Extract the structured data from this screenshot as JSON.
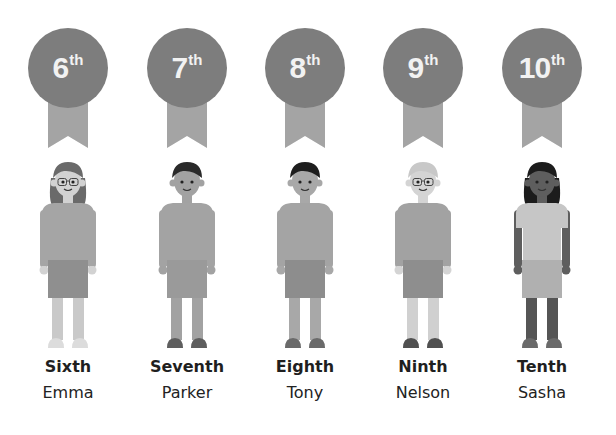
{
  "places": [
    {
      "number": "6",
      "suffix": "th",
      "ordinal": "Sixth",
      "name": "Emma",
      "colors": {
        "hair": "#6a6a6a",
        "skin": "#d2d2d2",
        "shirt": "#a5a5a5",
        "shorts": "#8f8f8f",
        "legs": "#c9c9c9",
        "shoes": "#dcdcdc"
      },
      "glasses": true,
      "long_hair": true
    },
    {
      "number": "7",
      "suffix": "th",
      "ordinal": "Seventh",
      "name": "Parker",
      "colors": {
        "hair": "#2a2a2a",
        "skin": "#a2a2a2",
        "shirt": "#a3a3a3",
        "shorts": "#9a9a9a",
        "legs": "#a2a2a2",
        "shoes": "#5e5e5e"
      },
      "glasses": false,
      "long_hair": false
    },
    {
      "number": "8",
      "suffix": "th",
      "ordinal": "Eighth",
      "name": "Tony",
      "colors": {
        "hair": "#1e1e1e",
        "skin": "#a8a8a8",
        "shirt": "#a4a4a4",
        "shorts": "#8d8d8d",
        "legs": "#a8a8a8",
        "shoes": "#6a6a6a"
      },
      "glasses": false,
      "long_hair": false
    },
    {
      "number": "9",
      "suffix": "th",
      "ordinal": "Ninth",
      "name": "Nelson",
      "colors": {
        "hair": "#c8c8c8",
        "skin": "#d4d4d4",
        "shirt": "#a2a2a2",
        "shorts": "#8e8e8e",
        "legs": "#d0d0d0",
        "shoes": "#505050"
      },
      "glasses": true,
      "long_hair": false
    },
    {
      "number": "10",
      "suffix": "th",
      "ordinal": "Tenth",
      "name": "Sasha",
      "colors": {
        "hair": "#1c1c1c",
        "skin": "#5e5e5e",
        "shirt": "#c6c6c6",
        "shorts": "#b0b0b0",
        "legs": "#555555",
        "shoes": "#6a6a6a"
      },
      "glasses": false,
      "long_hair": true
    }
  ],
  "medal_color": "#7d7d7d",
  "ribbon_color": "#a4a4a4"
}
